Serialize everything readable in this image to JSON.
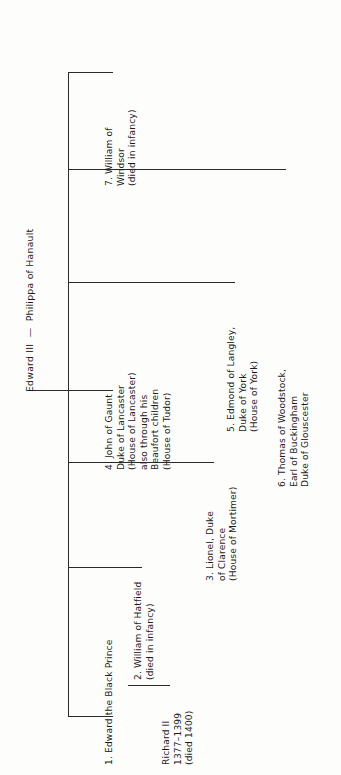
{
  "diagram": {
    "root": {
      "label": "Edward III  —  Philippa of Hanault"
    },
    "children": [
      {
        "id": "child-7",
        "lines": [
          "7. William of",
          "Windsor",
          "(died in infancy)"
        ],
        "text": "7. William of\nWindsor\n(died in infancy)"
      },
      {
        "id": "child-6",
        "lines": [
          "6. Thomas of Woodstock,",
          "Earl of Buckingham",
          "Duke of Glouscester"
        ],
        "text": "6. Thomas of Woodstock,\nEarl of Buckingham\nDuke of Glouscester"
      },
      {
        "id": "child-5",
        "lines": [
          "5. Edmond of Langley,",
          "Duke of York",
          "(House of York)"
        ],
        "text": "5. Edmond of Langley,\nDuke of York\n(House of York)"
      },
      {
        "id": "child-4",
        "lines": [
          "4. John of Gaunt",
          "Duke of Lancaster",
          "(House of Lancaster)",
          "also through his",
          "Beaufort children",
          "(House of Tudor)"
        ],
        "text": "4. John of Gaunt\nDuke of Lancaster\n(House of Lancaster)\nalso through his\nBeaufort children\n(House of Tudor)"
      },
      {
        "id": "child-3",
        "lines": [
          "3. Lionel, Duke",
          "of Clarence",
          "(House of Mortimer)"
        ],
        "text": "3. Lionel, Duke\nof Clarence\n(House of Mortimer)"
      },
      {
        "id": "child-2",
        "lines": [
          "2. William of Hatfield",
          "(died in infancy)"
        ],
        "text": "2. William of Hatfield\n(died in infancy)"
      },
      {
        "id": "child-1",
        "lines": [
          "1. Edward the Black Prince"
        ],
        "text": "1. Edward the Black Prince"
      }
    ],
    "grandchildren": [
      {
        "id": "richard-ii",
        "parent": "child-1",
        "lines": [
          "Richard II",
          "1377–1399",
          "(died 1400)"
        ],
        "text": "Richard II\n1377–1399\n(died 1400)"
      }
    ],
    "colors": {
      "line": "#2a2a2a",
      "text": "#1b1b1b",
      "background": "#fdfdfc"
    }
  }
}
